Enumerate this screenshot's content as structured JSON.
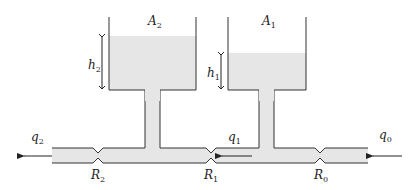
{
  "diagram": {
    "colors": {
      "liquid": "#e6e6e6",
      "stroke": "#333333",
      "background": "#ffffff"
    },
    "tanks": [
      {
        "id": "tank-2",
        "area_label": "A",
        "area_sub": "2",
        "level_label": "h",
        "level_sub": "2"
      },
      {
        "id": "tank-1",
        "area_label": "A",
        "area_sub": "1",
        "level_label": "h",
        "level_sub": "1"
      }
    ],
    "resistances": [
      {
        "id": "R2",
        "label": "R",
        "sub": "2"
      },
      {
        "id": "R1",
        "label": "R",
        "sub": "1"
      },
      {
        "id": "R0",
        "label": "R",
        "sub": "0"
      }
    ],
    "flows": [
      {
        "id": "q2",
        "label": "q",
        "sub": "2",
        "direction": "left"
      },
      {
        "id": "q1",
        "label": "q",
        "sub": "1",
        "direction": "left"
      },
      {
        "id": "q0",
        "label": "q",
        "sub": "0",
        "direction": "left"
      }
    ]
  }
}
